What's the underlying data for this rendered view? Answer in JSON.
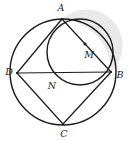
{
  "figure": {
    "background_color": "#ffffff",
    "ink_color": "#1c1c1c",
    "shade_color": "#e9e9e9"
  },
  "labels": [
    {
      "name": "label-A",
      "text": "A",
      "x": 61,
      "y": 8
    },
    {
      "name": "label-D",
      "text": "D",
      "x": 9,
      "y": 72
    },
    {
      "name": "label-B",
      "text": "B",
      "x": 120,
      "y": 75
    },
    {
      "name": "label-C",
      "text": "C",
      "x": 64,
      "y": 134
    },
    {
      "name": "label-M",
      "text": "M",
      "x": 89,
      "y": 55
    },
    {
      "name": "label-N",
      "text": "N",
      "x": 52,
      "y": 86
    }
  ],
  "points": {
    "A": {
      "x": 62,
      "y": 19
    },
    "D": {
      "x": 17,
      "y": 73
    },
    "B": {
      "x": 111,
      "y": 72
    },
    "C": {
      "x": 63,
      "y": 124
    },
    "M": {
      "x": 85,
      "y": 44
    }
  },
  "circles": {
    "outer": {
      "cx": 63,
      "cy": 72,
      "r": 53
    },
    "inner": {
      "cx": 80,
      "cy": 52,
      "r": 33
    }
  },
  "segments": [
    {
      "name": "segment-DB",
      "from": "D",
      "to": "B"
    },
    {
      "name": "segment-AD",
      "from": "A",
      "to": "D"
    },
    {
      "name": "segment-AB",
      "from": "A",
      "to": "B"
    },
    {
      "name": "segment-DC",
      "from": "D",
      "to": "C"
    },
    {
      "name": "segment-CB",
      "from": "C",
      "to": "B"
    }
  ]
}
